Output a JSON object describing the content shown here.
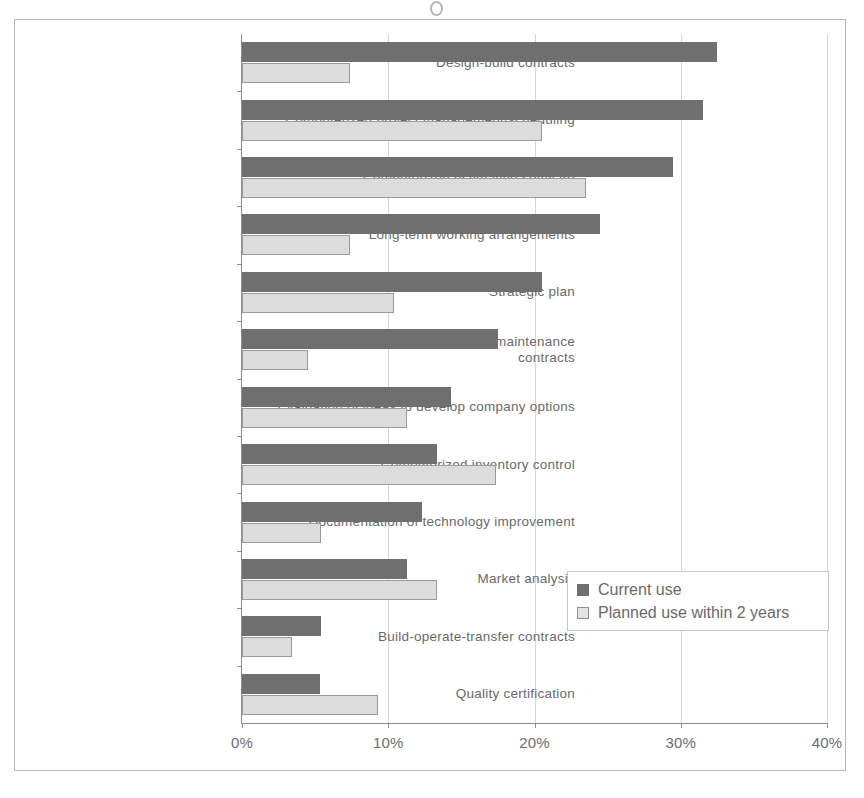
{
  "chart_data": {
    "type": "bar",
    "orientation": "horizontal",
    "title": "",
    "xlabel": "",
    "ylabel": "",
    "xlim": [
      0,
      40
    ],
    "xtick_labels": [
      "0%",
      "10%",
      "20%",
      "30%",
      "40%"
    ],
    "xticks": [
      0,
      10,
      20,
      30,
      40
    ],
    "grid": true,
    "legend_position": "center-right",
    "categories": [
      "Design-build contracts",
      "Computerized project management/scheduling",
      "Computerized estimating software",
      "Long-term working arrangements",
      "Strategic plan",
      "Post-commissioning inspection or maintenance contracts",
      "Evaluation of ideas to develop company options",
      "Computerized inventory control",
      "Documentation of technology improvement",
      "Market analysis",
      "Build-operate-transfer contracts",
      "Quality certification"
    ],
    "series": [
      {
        "name": "Current use",
        "color": "#6f6f6f",
        "values": [
          32.5,
          31.5,
          29.5,
          24.5,
          20.5,
          17.5,
          14.3,
          13.3,
          12.3,
          11.3,
          5.4,
          5.3
        ]
      },
      {
        "name": "Planned use within 2 years",
        "color": "#dcdcdc",
        "values": [
          7.4,
          20.5,
          23.5,
          7.4,
          10.4,
          4.5,
          11.3,
          17.4,
          5.4,
          13.3,
          3.4,
          9.3
        ]
      }
    ]
  },
  "legend": {
    "items": [
      {
        "label": "Current use"
      },
      {
        "label": "Planned use within 2 years"
      }
    ]
  }
}
